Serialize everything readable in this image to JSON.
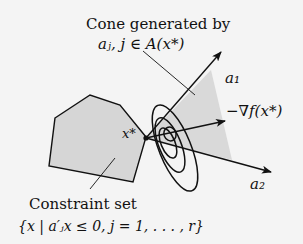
{
  "figure": {
    "cone_label": {
      "line1": "Cone generated by",
      "line2": "aⱼ, j ∈ A(x*)"
    },
    "vectors": {
      "a1": "a₁",
      "a2": "a₂",
      "neg_gradient": "−∇f(x*)"
    },
    "point_label": "x*",
    "constraint_label": {
      "line1": "Constraint set",
      "line2": "{x | a′ⱼx ≤ 0, j = 1, . . . , r}"
    },
    "colors": {
      "background": "#f4f4f4",
      "constraint_fill": "#d6d6d6",
      "cone_fill": "#d9d9d9",
      "stroke": "#111111"
    }
  }
}
